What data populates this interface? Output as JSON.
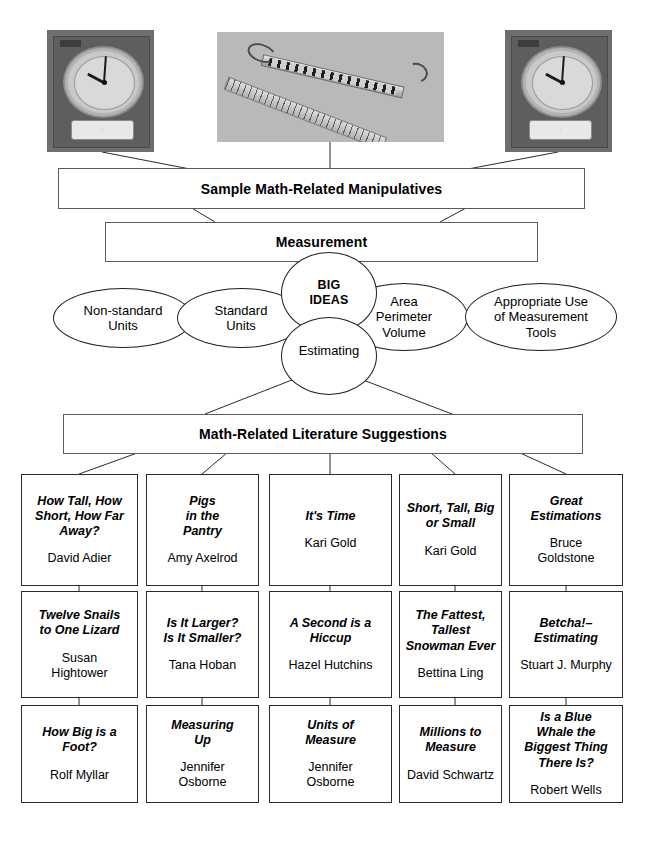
{
  "photos": [
    {
      "name": "teaching-clock-left",
      "alt": "Judy teaching clock manipulative",
      "time": "9:02"
    },
    {
      "name": "ruler-and-spring-scale",
      "alt": "Ruler and spring scale on gray background"
    },
    {
      "name": "teaching-clock-right",
      "alt": "Judy teaching clock manipulative",
      "time": "9:02"
    }
  ],
  "nodes": {
    "manipulatives": "Sample Math-Related Manipulatives",
    "measurement": "Measurement",
    "literature": "Math-Related Literature Suggestions"
  },
  "ovals": {
    "big_ideas": "BIG\nIDEAS",
    "estimating": "Estimating",
    "non_standard_units": "Non-standard\nUnits",
    "standard_units": "Standard\nUnits",
    "area_perimeter_volume": "Area\nPerimeter\nVolume",
    "appropriate_use": "Appropriate Use\nof Measurement\nTools"
  },
  "books": [
    [
      {
        "title": "How Tall, How\nShort, How Far\nAway?",
        "author": "David Adier"
      },
      {
        "title": "Pigs\nin the\nPantry",
        "author": "Amy Axelrod"
      },
      {
        "title": "It's Time",
        "author": "Kari Gold"
      },
      {
        "title": "Short, Tall, Big\nor Small",
        "author": "Kari Gold"
      },
      {
        "title": "Great\nEstimations",
        "author": "Bruce\nGoldstone"
      }
    ],
    [
      {
        "title": "Twelve Snails\nto One Lizard",
        "author": "Susan\nHightower"
      },
      {
        "title": "Is It Larger?\nIs It Smaller?",
        "author": "Tana Hoban"
      },
      {
        "title": "A Second is a\nHiccup",
        "author": "Hazel Hutchins"
      },
      {
        "title": "The Fattest,\nTallest\nSnowman Ever",
        "author": "Bettina Ling"
      },
      {
        "title": "Betcha!–\nEstimating",
        "author": "Stuart J. Murphy"
      }
    ],
    [
      {
        "title": "How Big is a\nFoot?",
        "author": "Rolf Myllar"
      },
      {
        "title": "Measuring\nUp",
        "author": "Jennifer\nOsborne"
      },
      {
        "title": "Units of\nMeasure",
        "author": "Jennifer\nOsborne"
      },
      {
        "title": "Millions to\nMeasure",
        "author": "David Schwartz"
      },
      {
        "title": "Is a Blue\nWhale the\nBiggest Thing\nThere Is?",
        "author": "Robert Wells"
      }
    ]
  ],
  "colors": {
    "line": "#2b2b2b",
    "box_border": "#5c5c5c",
    "book_border": "#2a2a2a",
    "text": "#000000",
    "page_background": "#ffffff"
  }
}
